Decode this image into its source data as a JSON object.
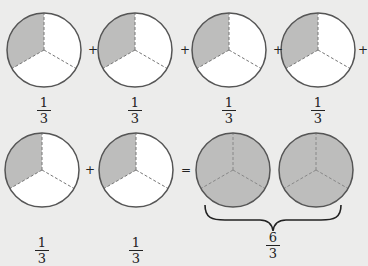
{
  "figure": {
    "colors": {
      "background": "#ececeb",
      "shaded": "#bdbdbc",
      "unshaded": "#ffffff",
      "outline": "#555555",
      "dashed": "#777777"
    },
    "top_row": {
      "terms": [
        {
          "numerator": "1",
          "denominator": "3",
          "shaded_parts": 1
        },
        {
          "numerator": "1",
          "denominator": "3",
          "shaded_parts": 1
        },
        {
          "numerator": "1",
          "denominator": "3",
          "shaded_parts": 1
        },
        {
          "numerator": "1",
          "denominator": "3",
          "shaded_parts": 1
        }
      ],
      "operators": [
        "+",
        "+",
        "+",
        "+"
      ]
    },
    "bottom_row": {
      "terms": [
        {
          "numerator": "1",
          "denominator": "3",
          "shaded_parts": 1
        },
        {
          "numerator": "1",
          "denominator": "3",
          "shaded_parts": 1
        }
      ],
      "operators": [
        "+",
        "="
      ],
      "result": {
        "circles": [
          {
            "shaded_parts": 3
          },
          {
            "shaded_parts": 3
          }
        ],
        "numerator": "6",
        "denominator": "3"
      }
    }
  }
}
